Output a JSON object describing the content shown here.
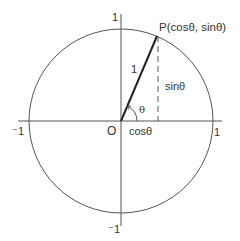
{
  "diagram": {
    "labels": {
      "point_p": "P(cosθ, sinθ)",
      "origin": "O",
      "radius": "1",
      "angle": "θ",
      "cos": "cosθ",
      "sin": "sinθ",
      "x_pos": "1",
      "x_neg": "⁻1",
      "y_pos": "1",
      "y_neg": "⁻1"
    },
    "colors": {
      "line": "#555555",
      "radius_line": "#222222",
      "text": "#333333",
      "background": "#ffffff"
    },
    "geometry": {
      "center": [
        121,
        121
      ],
      "radius": 92,
      "angle_deg": 67,
      "point_p": [
        157,
        36
      ]
    }
  }
}
